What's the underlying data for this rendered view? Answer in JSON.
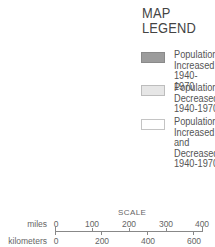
{
  "legend": {
    "title_line1": "MAP",
    "title_line2": "LEGEND",
    "items": [
      {
        "swatch": "dark-gray",
        "color": "#9c9c9c",
        "label_lines": [
          "Population",
          "Increased",
          "1940-1970"
        ]
      },
      {
        "swatch": "light-gray",
        "color": "#e6e6e6",
        "label_lines": [
          "Population",
          "Decreased",
          "1940-1970"
        ]
      },
      {
        "swatch": "white",
        "color": "#ffffff",
        "label_lines": [
          "Population",
          "Increased",
          "and",
          "Decreased",
          "1940-1970"
        ]
      }
    ]
  },
  "scale": {
    "title": "SCALE",
    "miles": {
      "label": "miles",
      "ticks": [
        "0",
        "100",
        "200",
        "300",
        "400"
      ]
    },
    "kilometers": {
      "label": "kilometers",
      "ticks": [
        "0",
        "200",
        "400",
        "600"
      ]
    }
  }
}
